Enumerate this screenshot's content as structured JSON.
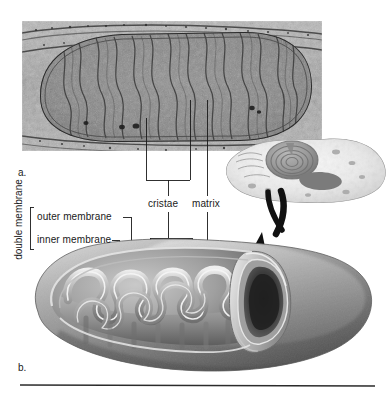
{
  "figure": {
    "panels": [
      {
        "id": "a",
        "letter": "a.",
        "caption": "transmission electron micrograph of a mitochondrion"
      },
      {
        "id": "b",
        "letter": "b.",
        "caption": "cut-away illustration of a mitochondrion"
      }
    ],
    "labels": {
      "double_membrane": "double membrane",
      "outer_membrane": "outer membrane",
      "inner_membrane": "inner membrane",
      "cristae": "cristae",
      "matrix": "matrix"
    },
    "inset": {
      "name": "cell-inset",
      "description": "whole animal cell drawing"
    },
    "colors": {
      "line": "#1a1a1a",
      "text": "#1a1a1a",
      "background": "#ffffff",
      "micrograph_mid": "#8d8d8d",
      "micrograph_dark": "#3a3a3a",
      "diagram_light": "#e8e8e8",
      "diagram_mid": "#9b9b9b",
      "diagram_dark": "#4d4d4d",
      "rule": "#2b2b2b"
    }
  }
}
